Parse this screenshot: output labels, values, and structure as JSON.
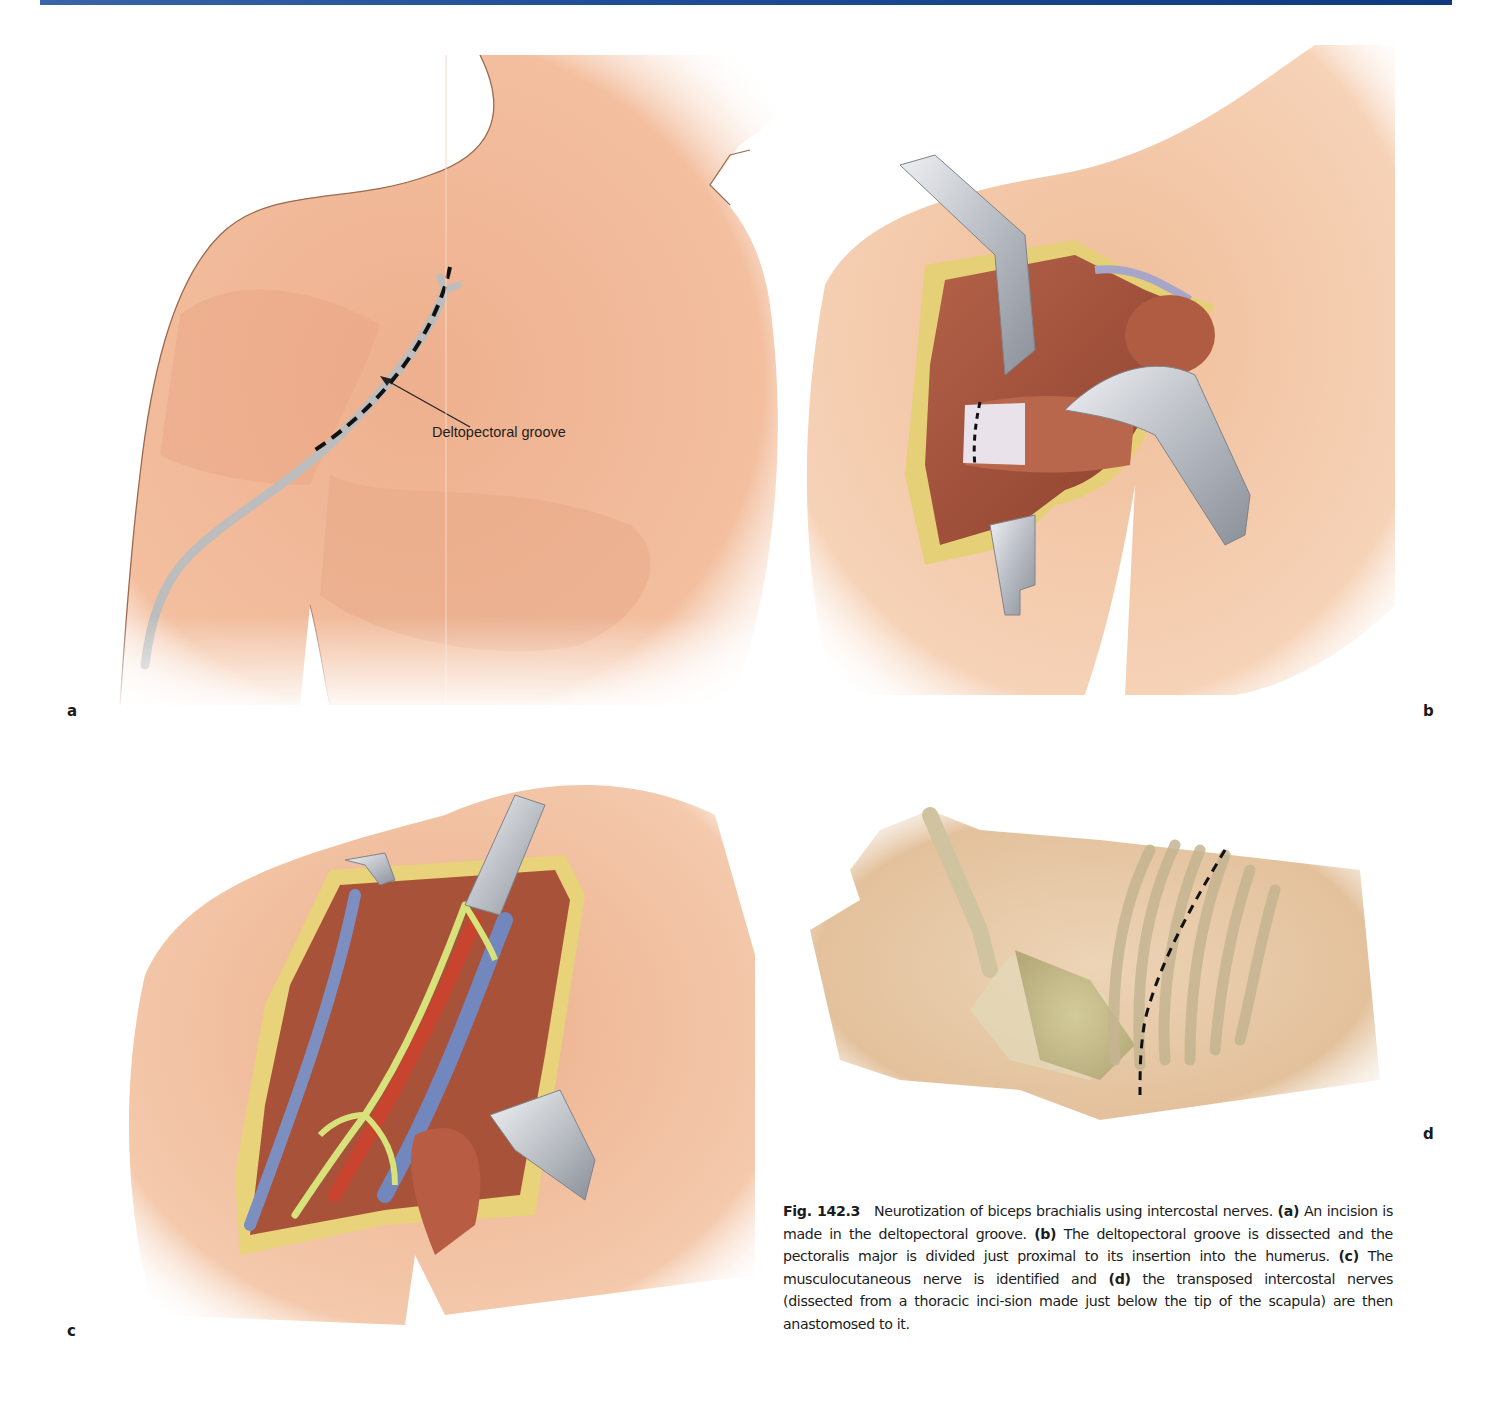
{
  "page": {
    "header_rule_color": "#1d4f97"
  },
  "figure": {
    "number": "Fig. 142.3",
    "title": "Neurotization of biceps brachialis using intercostal nerves.",
    "panels": [
      {
        "label": "a",
        "description": "Shoulder and chest with dashed incision line along the deltopectoral groove",
        "callout": "Deltopectoral groove"
      },
      {
        "label": "b",
        "description": "Deltopectoral groove dissected with retractors; pectoralis major divided near insertion (dashed line)"
      },
      {
        "label": "c",
        "description": "Exposure of musculocutaneous nerve with vessels and nerves, retractors in place"
      },
      {
        "label": "d",
        "description": "Lateral thorax showing scapula and ribs with dashed thoracic incision below scapular tip"
      }
    ],
    "caption_parts": [
      {
        "tag": "(a)",
        "text": " An incision is made in the deltopectoral groove. "
      },
      {
        "tag": "(b)",
        "text": " The deltopectoral groove is dissected and the pectoralis major is divided just proximal to its insertion into the humerus. "
      },
      {
        "tag": "(c)",
        "text": " The musculocutaneous nerve is identified and "
      },
      {
        "tag": "(d)",
        "text": " the transposed intercostal nerves (dissected from a thoracic inci-sion made just below the tip of the scapula) are then anastomosed to it."
      }
    ]
  },
  "colors": {
    "skin": "#f2b896",
    "skin_light": "#f7d6c0",
    "muscle": "#a8523a",
    "vein": "#7d8fc0",
    "nerve": "#d8e27a",
    "artery": "#c8442e",
    "retractor": "#c8cbd0",
    "fat": "#e8d27a",
    "bone": "#d8cfa8"
  }
}
